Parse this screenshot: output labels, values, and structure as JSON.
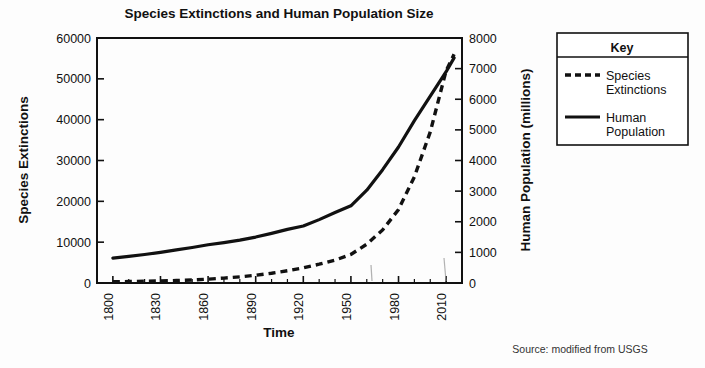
{
  "chart_data": {
    "type": "line",
    "title": "Species Extinctions and Human Population Size",
    "xlabel": "Time",
    "ylabel": "Species Extinctions",
    "y2label": "Human Population (millions)",
    "xlim": [
      1790,
      2020
    ],
    "ylim": [
      0,
      60000
    ],
    "y2lim": [
      0,
      8000
    ],
    "grid": false,
    "legend_position": "right-outside",
    "legend_title": "Key",
    "xticks": [
      1800,
      1830,
      1860,
      1890,
      1920,
      1950,
      1980,
      2010
    ],
    "xtick_labels": [
      "1800",
      "1830",
      "1860",
      "1890",
      "1920",
      "1950",
      "1980",
      "2010"
    ],
    "xminor_step": 10,
    "yticks": [
      0,
      10000,
      20000,
      30000,
      40000,
      50000,
      60000
    ],
    "ytick_labels": [
      "0",
      "10000",
      "20000",
      "30000",
      "40000",
      "50000",
      "60000"
    ],
    "y2ticks": [
      0,
      1000,
      2000,
      3000,
      4000,
      5000,
      6000,
      7000,
      8000
    ],
    "y2tick_labels": [
      "0",
      "1000",
      "2000",
      "3000",
      "4000",
      "5000",
      "6000",
      "7000",
      "8000"
    ],
    "series": [
      {
        "name": "Species Extinctions",
        "axis": "left",
        "style": "dashed",
        "units": "species extinctions",
        "x": [
          1800,
          1810,
          1820,
          1830,
          1840,
          1850,
          1860,
          1870,
          1880,
          1890,
          1900,
          1910,
          1920,
          1930,
          1940,
          1950,
          1960,
          1970,
          1980,
          1990,
          2000,
          2010,
          2015
        ],
        "values": [
          300,
          350,
          420,
          500,
          600,
          750,
          950,
          1200,
          1500,
          1900,
          2400,
          3000,
          3700,
          4600,
          5600,
          7000,
          9500,
          13000,
          18000,
          26000,
          37000,
          52000,
          56000
        ]
      },
      {
        "name": "Human Population",
        "axis": "right",
        "style": "solid",
        "units": "millions",
        "x": [
          1800,
          1810,
          1820,
          1830,
          1840,
          1850,
          1860,
          1870,
          1880,
          1890,
          1900,
          1910,
          1920,
          1930,
          1940,
          1950,
          1960,
          1970,
          1980,
          1990,
          2000,
          2010,
          2015
        ],
        "values": [
          810,
          870,
          930,
          1000,
          1080,
          1160,
          1250,
          1320,
          1400,
          1500,
          1620,
          1750,
          1860,
          2070,
          2300,
          2520,
          3030,
          3700,
          4440,
          5300,
          6100,
          6900,
          7350
        ]
      }
    ],
    "legend_entries": [
      {
        "label_line1": "Species",
        "label_line2": "Extinctions",
        "style": "dashed"
      },
      {
        "label_line1": "Human",
        "label_line2": "Population",
        "style": "solid"
      }
    ],
    "source_note": "Source: modified from USGS"
  }
}
